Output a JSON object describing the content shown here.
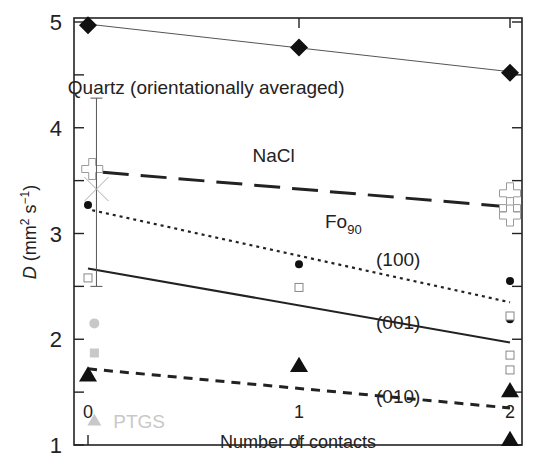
{
  "chart_data": {
    "type": "scatter",
    "title": "",
    "xlabel": "Number of contacts",
    "ylabel": "D (mm² s⁻¹)",
    "ylabel_parts": {
      "italic": "D",
      "rest_pre": " (mm",
      "sup1": "2",
      "mid": " s",
      "sup2": "−1",
      "post": ")"
    },
    "xlim": [
      -0.07,
      2.06
    ],
    "ylim": [
      1,
      5
    ],
    "xticks": [
      0,
      1,
      2
    ],
    "xtick_labels": [
      "0",
      "1",
      "2"
    ],
    "yticks": [
      1,
      2,
      3,
      4,
      5
    ],
    "ytick_labels": [
      "1",
      "2",
      "3",
      "4",
      "5"
    ],
    "yminor_ticks": [
      1.5,
      2.5,
      3.5,
      4.5
    ],
    "grid": false,
    "annotations": [
      {
        "text": "Quartz (orientationally averaged)",
        "x": 0.56,
        "y": 4.32
      },
      {
        "text": "NaCl",
        "x": 0.88,
        "y": 3.68
      },
      {
        "text": "Fo",
        "sub": "90",
        "x": 1.21,
        "y": 3.05
      },
      {
        "text": "(100)",
        "x": 1.47,
        "y": 2.69
      },
      {
        "text": "(001)",
        "x": 1.47,
        "y": 2.1
      },
      {
        "text": "(010)",
        "x": 1.47,
        "y": 1.4
      },
      {
        "text": "PTGS",
        "x": 0.12,
        "y": 1.23,
        "color": "#c8c8c8"
      }
    ],
    "lines": [
      {
        "name": "Quartz fit",
        "style": "solid-thin",
        "x": [
          0,
          2
        ],
        "y": [
          4.98,
          4.53
        ],
        "color": "#555555"
      },
      {
        "name": "NaCl fit",
        "style": "long-dash",
        "x": [
          0.07,
          2
        ],
        "y": [
          3.58,
          3.25
        ],
        "color": "#222222"
      },
      {
        "name": "(100) fit",
        "style": "dotted",
        "x": [
          0.02,
          2
        ],
        "y": [
          3.22,
          2.35
        ],
        "color": "#222222"
      },
      {
        "name": "(001) fit",
        "style": "solid",
        "x": [
          0,
          2
        ],
        "y": [
          2.67,
          1.97
        ],
        "color": "#222222"
      },
      {
        "name": "(010) fit",
        "style": "dashed",
        "x": [
          0,
          2
        ],
        "y": [
          1.72,
          1.35
        ],
        "color": "#222222"
      }
    ],
    "series": [
      {
        "name": "Quartz",
        "marker": "diamond-filled",
        "color": "#111111",
        "x": [
          0,
          1,
          2
        ],
        "y": [
          4.97,
          4.76,
          4.52
        ]
      },
      {
        "name": "NaCl",
        "marker": "cross-open",
        "color": "#999999",
        "x": [
          0.02,
          2,
          2,
          2
        ],
        "y": [
          3.61,
          3.38,
          3.24,
          3.17
        ]
      },
      {
        "name": "Fo90 (100)",
        "marker": "circle-filled",
        "color": "#111111",
        "x": [
          0,
          1,
          2,
          2
        ],
        "y": [
          3.27,
          2.71,
          2.55,
          2.19
        ]
      },
      {
        "name": "Fo90 (001)",
        "marker": "square-open",
        "color": "#888888",
        "x": [
          0,
          1,
          2,
          2,
          2
        ],
        "y": [
          2.58,
          2.49,
          2.22,
          1.85,
          1.71
        ]
      },
      {
        "name": "Fo90 (010)",
        "marker": "triangle-filled",
        "color": "#111111",
        "x": [
          0,
          1,
          2,
          2
        ],
        "y": [
          1.66,
          1.75,
          1.51,
          1.05
        ]
      },
      {
        "name": "PTGS",
        "marker": "gray-mixed",
        "color": "#c8c8c8",
        "points": [
          {
            "shape": "circle",
            "x": 0.03,
            "y": 2.15
          },
          {
            "shape": "square",
            "x": 0.03,
            "y": 1.87
          },
          {
            "shape": "triangle",
            "x": 0.03,
            "y": 1.23
          }
        ]
      },
      {
        "name": "Mean with error bar",
        "marker": "x",
        "color": "#aaaaaa",
        "x": [
          0.04
        ],
        "y": [
          3.42
        ],
        "yerr_low": [
          2.5
        ],
        "yerr_high": [
          4.28
        ]
      }
    ]
  }
}
